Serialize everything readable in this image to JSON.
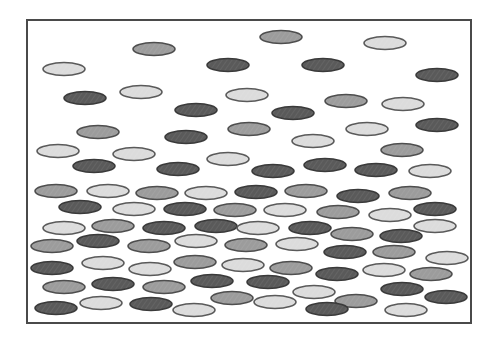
{
  "diagram": {
    "canvas": {
      "width": 497,
      "height": 347,
      "background": "#ffffff"
    },
    "frame": {
      "x": 27,
      "y": 20,
      "width": 444,
      "height": 303,
      "stroke": "#4a4a4a",
      "stroke_width": 2
    },
    "particle_size": {
      "rx": 21,
      "ry": 6.5
    },
    "shades": {
      "light": {
        "fill": "#dcdcdc",
        "stroke": "#5a5a5a"
      },
      "medium": {
        "fill": "#9c9c9c",
        "stroke": "#4e4e4e"
      },
      "dark": {
        "fill": "#5a5a5a",
        "stroke": "#3a3a3a"
      }
    },
    "particles": [
      {
        "x": 154,
        "y": 49,
        "shade": "medium"
      },
      {
        "x": 281,
        "y": 37,
        "shade": "medium"
      },
      {
        "x": 385,
        "y": 43,
        "shade": "light"
      },
      {
        "x": 64,
        "y": 69,
        "shade": "light"
      },
      {
        "x": 228,
        "y": 65,
        "shade": "dark"
      },
      {
        "x": 323,
        "y": 65,
        "shade": "dark"
      },
      {
        "x": 437,
        "y": 75,
        "shade": "dark"
      },
      {
        "x": 85,
        "y": 98,
        "shade": "dark"
      },
      {
        "x": 141,
        "y": 92,
        "shade": "light"
      },
      {
        "x": 247,
        "y": 95,
        "shade": "light"
      },
      {
        "x": 196,
        "y": 110,
        "shade": "dark"
      },
      {
        "x": 293,
        "y": 113,
        "shade": "dark"
      },
      {
        "x": 346,
        "y": 101,
        "shade": "medium"
      },
      {
        "x": 403,
        "y": 104,
        "shade": "light"
      },
      {
        "x": 98,
        "y": 132,
        "shade": "medium"
      },
      {
        "x": 186,
        "y": 137,
        "shade": "dark"
      },
      {
        "x": 249,
        "y": 129,
        "shade": "medium"
      },
      {
        "x": 367,
        "y": 129,
        "shade": "light"
      },
      {
        "x": 437,
        "y": 125,
        "shade": "dark"
      },
      {
        "x": 313,
        "y": 141,
        "shade": "light"
      },
      {
        "x": 58,
        "y": 151,
        "shade": "light"
      },
      {
        "x": 134,
        "y": 154,
        "shade": "light"
      },
      {
        "x": 228,
        "y": 159,
        "shade": "light"
      },
      {
        "x": 402,
        "y": 150,
        "shade": "medium"
      },
      {
        "x": 94,
        "y": 166,
        "shade": "dark"
      },
      {
        "x": 178,
        "y": 169,
        "shade": "dark"
      },
      {
        "x": 273,
        "y": 171,
        "shade": "dark"
      },
      {
        "x": 325,
        "y": 165,
        "shade": "dark"
      },
      {
        "x": 376,
        "y": 170,
        "shade": "dark"
      },
      {
        "x": 430,
        "y": 171,
        "shade": "light"
      },
      {
        "x": 56,
        "y": 191,
        "shade": "medium"
      },
      {
        "x": 108,
        "y": 191,
        "shade": "light"
      },
      {
        "x": 157,
        "y": 193,
        "shade": "medium"
      },
      {
        "x": 206,
        "y": 193,
        "shade": "light"
      },
      {
        "x": 256,
        "y": 192,
        "shade": "dark"
      },
      {
        "x": 306,
        "y": 191,
        "shade": "medium"
      },
      {
        "x": 358,
        "y": 196,
        "shade": "dark"
      },
      {
        "x": 410,
        "y": 193,
        "shade": "medium"
      },
      {
        "x": 80,
        "y": 207,
        "shade": "dark"
      },
      {
        "x": 134,
        "y": 209,
        "shade": "light"
      },
      {
        "x": 185,
        "y": 209,
        "shade": "dark"
      },
      {
        "x": 235,
        "y": 210,
        "shade": "medium"
      },
      {
        "x": 285,
        "y": 210,
        "shade": "light"
      },
      {
        "x": 338,
        "y": 212,
        "shade": "medium"
      },
      {
        "x": 390,
        "y": 215,
        "shade": "light"
      },
      {
        "x": 435,
        "y": 209,
        "shade": "dark"
      },
      {
        "x": 64,
        "y": 228,
        "shade": "light"
      },
      {
        "x": 113,
        "y": 226,
        "shade": "medium"
      },
      {
        "x": 164,
        "y": 228,
        "shade": "dark"
      },
      {
        "x": 216,
        "y": 226,
        "shade": "dark"
      },
      {
        "x": 258,
        "y": 228,
        "shade": "light"
      },
      {
        "x": 310,
        "y": 228,
        "shade": "dark"
      },
      {
        "x": 352,
        "y": 234,
        "shade": "medium"
      },
      {
        "x": 401,
        "y": 236,
        "shade": "dark"
      },
      {
        "x": 435,
        "y": 226,
        "shade": "light"
      },
      {
        "x": 52,
        "y": 246,
        "shade": "medium"
      },
      {
        "x": 98,
        "y": 241,
        "shade": "dark"
      },
      {
        "x": 149,
        "y": 246,
        "shade": "medium"
      },
      {
        "x": 196,
        "y": 241,
        "shade": "light"
      },
      {
        "x": 246,
        "y": 245,
        "shade": "medium"
      },
      {
        "x": 297,
        "y": 244,
        "shade": "light"
      },
      {
        "x": 345,
        "y": 252,
        "shade": "dark"
      },
      {
        "x": 394,
        "y": 252,
        "shade": "medium"
      },
      {
        "x": 447,
        "y": 258,
        "shade": "light"
      },
      {
        "x": 52,
        "y": 268,
        "shade": "dark"
      },
      {
        "x": 103,
        "y": 263,
        "shade": "light"
      },
      {
        "x": 150,
        "y": 269,
        "shade": "light"
      },
      {
        "x": 195,
        "y": 262,
        "shade": "medium"
      },
      {
        "x": 243,
        "y": 265,
        "shade": "light"
      },
      {
        "x": 291,
        "y": 268,
        "shade": "medium"
      },
      {
        "x": 337,
        "y": 274,
        "shade": "dark"
      },
      {
        "x": 384,
        "y": 270,
        "shade": "light"
      },
      {
        "x": 431,
        "y": 274,
        "shade": "medium"
      },
      {
        "x": 64,
        "y": 287,
        "shade": "medium"
      },
      {
        "x": 113,
        "y": 284,
        "shade": "dark"
      },
      {
        "x": 164,
        "y": 287,
        "shade": "medium"
      },
      {
        "x": 212,
        "y": 281,
        "shade": "dark"
      },
      {
        "x": 268,
        "y": 282,
        "shade": "dark"
      },
      {
        "x": 314,
        "y": 292,
        "shade": "light"
      },
      {
        "x": 356,
        "y": 301,
        "shade": "medium"
      },
      {
        "x": 402,
        "y": 289,
        "shade": "dark"
      },
      {
        "x": 446,
        "y": 297,
        "shade": "dark"
      },
      {
        "x": 56,
        "y": 308,
        "shade": "dark"
      },
      {
        "x": 101,
        "y": 303,
        "shade": "light"
      },
      {
        "x": 151,
        "y": 304,
        "shade": "dark"
      },
      {
        "x": 194,
        "y": 310,
        "shade": "light"
      },
      {
        "x": 232,
        "y": 298,
        "shade": "medium"
      },
      {
        "x": 275,
        "y": 302,
        "shade": "light"
      },
      {
        "x": 327,
        "y": 309,
        "shade": "dark"
      },
      {
        "x": 406,
        "y": 310,
        "shade": "light"
      }
    ]
  }
}
